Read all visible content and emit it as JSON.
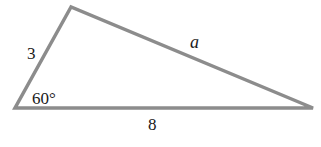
{
  "diagram": {
    "type": "triangle",
    "stroke_color": "#8c8c8c",
    "vertices": {
      "top": [
        71,
        7
      ],
      "left": [
        15,
        108
      ],
      "right": [
        313,
        108
      ]
    },
    "labels": {
      "left_side": "3",
      "top_right_side": "a",
      "bottom_side": "8",
      "angle": "60°"
    }
  }
}
